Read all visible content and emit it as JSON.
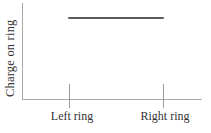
{
  "chart_data": {
    "type": "line",
    "title": "",
    "xlabel": "",
    "ylabel": "Charge on ring",
    "x_tick_labels": [
      "Left ring",
      "Right ring"
    ],
    "y_tick_labels": [],
    "series": [
      {
        "name": "charge-on-ring",
        "x": [
          "Left ring",
          "Right ring"
        ],
        "values": [
          1,
          1
        ],
        "note": "Horizontal straight line at a constant high charge value spanning from the Left ring tick to the Right ring tick; no numeric y-scale shown"
      }
    ],
    "ylim_note": "unlabeled qualitative axis; line sits near top of plot area",
    "grid": false,
    "legend": false
  },
  "colors": {
    "background": "#ffffff",
    "axis": "#a8a8a8",
    "tick": "#9a9a9a",
    "line": "#5c5c5c",
    "text": "#333333"
  }
}
